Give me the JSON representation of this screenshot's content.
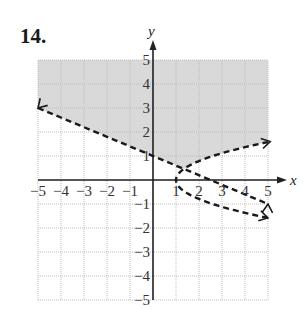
{
  "problem": {
    "number": "14."
  },
  "chart_data": {
    "type": "line",
    "title": "",
    "xlabel": "x",
    "ylabel": "y",
    "xlim": [
      -5,
      5
    ],
    "ylim": [
      -5,
      5
    ],
    "grid": true,
    "x_ticks": [
      -5,
      -4,
      -3,
      -2,
      -1,
      1,
      2,
      3,
      4,
      5
    ],
    "y_ticks": [
      5,
      4,
      3,
      2,
      1,
      -1,
      -2,
      -3,
      -4,
      -5
    ],
    "x_tick_labels": [
      "−5",
      "−4",
      "−3",
      "−2",
      "−1",
      "1",
      "2",
      "3",
      "4",
      "5"
    ],
    "y_tick_labels": [
      "5",
      "4",
      "3",
      "2",
      "1",
      "−1",
      "−2",
      "−3",
      "−4",
      "−5"
    ],
    "series": [
      {
        "name": "line (dashed boundary)",
        "style": "dashed",
        "equation": "y = -0.4x + 1",
        "points": [
          [
            -5,
            3
          ],
          [
            0,
            1
          ],
          [
            5,
            -1
          ]
        ]
      },
      {
        "name": "sideways parabola (dashed boundary)",
        "style": "dashed",
        "equation": "x ≈ 1 + 1.6y²",
        "vertex": [
          1,
          0
        ],
        "points": [
          [
            5,
            1.6
          ],
          [
            3,
            1.1
          ],
          [
            1.3,
            0.45
          ],
          [
            1,
            0
          ],
          [
            1.4,
            -0.5
          ],
          [
            3,
            -1.1
          ],
          [
            5,
            -1.55
          ]
        ]
      }
    ],
    "shaded_region": {
      "description": "Region above the dashed line and outside (left/above) the parabola, up to y = 5",
      "color": "#d9d9d9"
    }
  },
  "colors": {
    "shade": "#d9d9d9",
    "grid": "#bdbdbd",
    "axis": "#222222",
    "curve": "#1a1a1a"
  }
}
